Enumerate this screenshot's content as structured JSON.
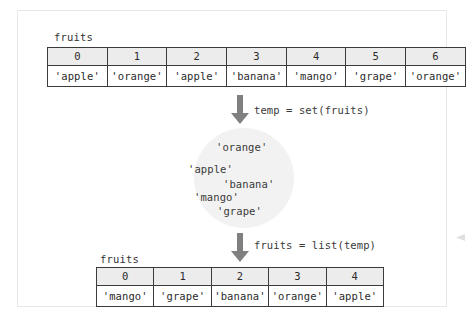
{
  "panel": {
    "top_table": {
      "var_label": "fruits",
      "indices": [
        "0",
        "1",
        "2",
        "3",
        "4",
        "5",
        "6"
      ],
      "values": [
        "'apple'",
        "'orange'",
        "'apple'",
        "'banana'",
        "'mango'",
        "'grape'",
        "'orange'"
      ]
    },
    "step_one": {
      "code": "temp = set(fruits)",
      "arrow_icon": "arrow-down-icon"
    },
    "set_bubble": {
      "items": [
        "'orange'",
        "'apple'",
        "'banana'",
        "'mango'",
        "'grape'"
      ],
      "fill_color": "#f2f2f2"
    },
    "step_two": {
      "code": "fruits = list(temp)",
      "arrow_icon": "arrow-down-icon"
    },
    "bottom_table": {
      "var_label": "fruits",
      "indices": [
        "0",
        "1",
        "2",
        "3",
        "4"
      ],
      "values": [
        "'mango'",
        "'grape'",
        "'banana'",
        "'orange'",
        "'apple'"
      ]
    },
    "colors": {
      "border": "#3b3b3b",
      "header_fill": "#ececec",
      "panel_border": "#e8e8e8",
      "text": "#2b2b2b",
      "arrow": "#808080"
    }
  }
}
